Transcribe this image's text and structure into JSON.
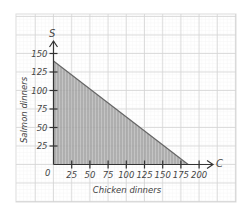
{
  "chart_data": {
    "type": "area",
    "title": "",
    "xlabel": "Chicken dinners",
    "ylabel": "Salmon dinners",
    "x_axis_letter": "C",
    "y_axis_letter": "S",
    "origin_label": "0",
    "x_ticks": [
      25,
      50,
      75,
      100,
      125,
      150,
      175,
      200
    ],
    "y_ticks": [
      25,
      50,
      75,
      100,
      125,
      150
    ],
    "xlim": [
      0,
      200
    ],
    "ylim": [
      0,
      150
    ],
    "grid": true,
    "legend": "none",
    "series": [
      {
        "name": "feasible region",
        "boundary_line": {
          "x_intercept": 185,
          "y_intercept": 140
        },
        "points": [
          [
            0,
            0
          ],
          [
            0,
            140
          ],
          [
            185,
            0
          ]
        ],
        "fill": "shaded (hatched gray)"
      }
    ]
  },
  "colors": {
    "grid_minor": "#eeeeee",
    "grid_major": "#d4d4d4",
    "axis": "#333333",
    "fill": "#9a9a9a",
    "text": "#444444"
  }
}
